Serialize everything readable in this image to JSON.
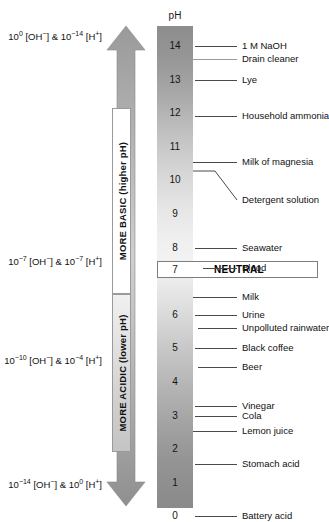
{
  "chart_data": {
    "type": "scale",
    "title": "pH",
    "axis": {
      "label": "pH",
      "ticks": [
        14,
        13,
        12,
        11,
        10,
        9,
        8,
        7,
        6,
        5,
        4,
        3,
        2,
        1,
        0
      ],
      "min": 0,
      "max": 14,
      "direction": "descending"
    },
    "annotations": [
      {
        "label": "1 M NaOH",
        "ph": 14.0
      },
      {
        "label": "Drain cleaner",
        "ph": 13.6
      },
      {
        "label": "Lye",
        "ph": 13.0
      },
      {
        "label": "Household ammonia",
        "ph": 11.9
      },
      {
        "label": "Milk of magnesia",
        "ph": 10.5
      },
      {
        "label": "Detergent solution",
        "ph": 10.0
      },
      {
        "label": "Seawater",
        "ph": 8.0
      },
      {
        "label": "Blood",
        "ph": 7.4
      },
      {
        "label": "NEUTRAL",
        "ph": 7.0
      },
      {
        "label": "Milk",
        "ph": 6.5
      },
      {
        "label": "Urine",
        "ph": 6.0
      },
      {
        "label": "Unpolluted rainwater",
        "ph": 5.6
      },
      {
        "label": "Black coffee",
        "ph": 5.0
      },
      {
        "label": "Beer",
        "ph": 4.5
      },
      {
        "label": "Vinegar",
        "ph": 3.3
      },
      {
        "label": "Cola",
        "ph": 3.0
      },
      {
        "label": "Lemon juice",
        "ph": 2.5
      },
      {
        "label": "Stomach acid",
        "ph": 1.5
      },
      {
        "label": "Battery acid",
        "ph": 0.0
      }
    ],
    "concentrations": [
      {
        "ph": 14,
        "oh_exp": "0",
        "h_exp": "-14"
      },
      {
        "ph": 7,
        "oh_exp": "-7",
        "h_exp": "-7"
      },
      {
        "ph": 4,
        "oh_exp": "-10",
        "h_exp": "-4"
      },
      {
        "ph": 0,
        "oh_exp": "-14",
        "h_exp": "0"
      }
    ]
  },
  "scale": {
    "header": "pH",
    "numbers": [
      "14",
      "13",
      "12",
      "11",
      "10",
      "9",
      "8",
      "7",
      "6",
      "5",
      "4",
      "3",
      "2",
      "1",
      "0"
    ]
  },
  "direction": {
    "basic_label": "MORE BASIC (higher pH)",
    "acidic_label": "MORE ACIDIC (lower pH)"
  },
  "neutral": {
    "number": "7",
    "label": "NEUTRAL"
  },
  "substances": [
    {
      "name": "1 M NaOH"
    },
    {
      "name": "Drain cleaner"
    },
    {
      "name": "Lye"
    },
    {
      "name": "Household ammonia"
    },
    {
      "name": "Milk of magnesia"
    },
    {
      "name": "Detergent solution"
    },
    {
      "name": "Seawater"
    },
    {
      "name": "Blood"
    },
    {
      "name": "Milk"
    },
    {
      "name": "Urine"
    },
    {
      "name": "Unpolluted rainwater"
    },
    {
      "name": "Black coffee"
    },
    {
      "name": "Beer"
    },
    {
      "name": "Vinegar"
    },
    {
      "name": "Cola"
    },
    {
      "name": "Lemon juice"
    },
    {
      "name": "Stomach acid"
    },
    {
      "name": "Battery acid"
    }
  ],
  "concentration_labels": [
    {
      "prefix": "10",
      "oh_exp": "0",
      "mid": " [OH",
      "ohsign": "−",
      "amp": "] & 10",
      "h_exp": "−14",
      "tail": " [H",
      "hsign": "+",
      "end": "]"
    },
    {
      "prefix": "10",
      "oh_exp": "−7",
      "mid": " [OH",
      "ohsign": "−",
      "amp": "] & 10",
      "h_exp": "−7",
      "tail": " [H",
      "hsign": "+",
      "end": "]"
    },
    {
      "prefix": "10",
      "oh_exp": "−10",
      "mid": " [OH",
      "ohsign": "−",
      "amp": "] & 10",
      "h_exp": "−4",
      "tail": " [H",
      "hsign": "+",
      "end": "]"
    },
    {
      "prefix": "10",
      "oh_exp": "−14",
      "mid": " [OH",
      "ohsign": "−",
      "amp": "] & 10",
      "h_exp": "0",
      "tail": " [H",
      "hsign": "+",
      "end": "]"
    }
  ],
  "colors": {
    "bar_top": "#8d8d8d",
    "bar_mid": "#f2f2f2",
    "bar_bottom": "#8a8a8a",
    "arrow": "#9d9d9d",
    "tick": "#4a4a4a",
    "text": "#111111"
  }
}
